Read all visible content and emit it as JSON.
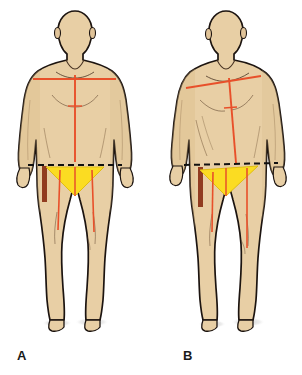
{
  "illustration": {
    "title": "Postural alignment comparison of two standing male figures",
    "background_color": "#ffffff",
    "panels": [
      {
        "id": "A",
        "label": "A",
        "label_x": 17,
        "label_y": 348,
        "caption": "Neutral symmetric standing posture with level reference lines",
        "posture": "aligned",
        "figure": {
          "skin_fill": "#e8cfa5",
          "skin_shade": "#d9b988",
          "outline_color": "#1c1410",
          "outline_width": 1.6,
          "center_x": 75,
          "head_center_x": 75,
          "head_center_y": 33,
          "head_rx": 17,
          "head_ry": 22
        },
        "markings": {
          "horizontal_line": {
            "name": "clavicular-reference-line",
            "color": "#e8502a",
            "x1": 33,
            "y1": 79,
            "x2": 116,
            "y2": 79,
            "width": 1.8,
            "tilt_degrees": 0
          },
          "vertical_line": {
            "name": "body-midline",
            "color": "#e8502a",
            "x1": 75,
            "y1": 75,
            "x2": 75,
            "y2": 162,
            "width": 1.8
          },
          "sternal_tick": {
            "name": "sternal-tick-mark",
            "color": "#e8502a",
            "x1": 68,
            "y1": 106,
            "x2": 82,
            "y2": 106,
            "width": 1.4
          },
          "dashed_line": {
            "name": "iliac-crest-line",
            "color": "#111111",
            "x1": 28,
            "y1": 165,
            "x2": 122,
            "y2": 165,
            "width": 2,
            "dash": "6 4",
            "tilt_degrees": 0
          },
          "triangle": {
            "name": "inguinal-triangle",
            "fill": "#fbdc22",
            "stroke": "#e0bd12",
            "points": "46,167 104,167 75,196",
            "apex_x": 75,
            "apex_y": 196
          },
          "lateral_band": {
            "name": "lateral-reference-band",
            "color": "#8c3418",
            "x": 42,
            "y": 166,
            "width": 5,
            "height": 36
          },
          "thigh_lines": [
            {
              "name": "left-thigh-line",
              "color": "#e8502a",
              "x1": 60,
              "y1": 170,
              "x2": 58,
              "y2": 230,
              "width": 1.6
            },
            {
              "name": "right-thigh-line",
              "color": "#e8502a",
              "x1": 92,
              "y1": 170,
              "x2": 94,
              "y2": 232,
              "width": 1.6
            }
          ],
          "shadow": {
            "name": "floor-shadow",
            "color": "#cfcfcf",
            "cx": 92,
            "cy": 322,
            "rx": 17,
            "ry": 4
          }
        }
      },
      {
        "id": "B",
        "label": "B",
        "label_x": 183,
        "label_y": 348,
        "caption": "Rotated asymmetric standing posture with oblique reference lines",
        "posture": "rotated",
        "figure": {
          "skin_fill": "#e8cfa5",
          "skin_shade": "#d9b988",
          "outline_color": "#1c1410",
          "outline_width": 1.6,
          "center_x": 228,
          "head_center_x": 226,
          "head_center_y": 33,
          "head_rx": 17,
          "head_ry": 22
        },
        "markings": {
          "horizontal_line": {
            "name": "clavicular-reference-line",
            "color": "#e8502a",
            "x1": 186,
            "y1": 88,
            "x2": 261,
            "y2": 76,
            "width": 1.8,
            "tilt_degrees": -9
          },
          "vertical_line": {
            "name": "body-midline",
            "color": "#e8502a",
            "x1": 229,
            "y1": 78,
            "x2": 236,
            "y2": 163,
            "width": 1.8
          },
          "sternal_tick": {
            "name": "sternal-tick-mark",
            "color": "#e8502a",
            "x1": 224,
            "y1": 108,
            "x2": 237,
            "y2": 107,
            "width": 1.4
          },
          "dashed_line": {
            "name": "iliac-crest-line",
            "color": "#111111",
            "x1": 184,
            "y1": 165,
            "x2": 278,
            "y2": 163,
            "width": 2,
            "dash": "6 4",
            "tilt_degrees": -1
          },
          "triangle": {
            "name": "inguinal-triangle",
            "fill": "#fbdc22",
            "stroke": "#e0bd12",
            "points": "200,170 258,166 226,196",
            "apex_x": 226,
            "apex_y": 196
          },
          "lateral_band": {
            "name": "lateral-reference-band",
            "color": "#8c3418",
            "x": 198,
            "y": 167,
            "width": 5,
            "height": 40
          },
          "thigh_lines": [
            {
              "name": "left-thigh-line",
              "color": "#e8502a",
              "x1": 213,
              "y1": 172,
              "x2": 212,
              "y2": 232,
              "width": 1.6
            },
            {
              "name": "right-thigh-line",
              "color": "#e8502a",
              "x1": 247,
              "y1": 168,
              "x2": 247,
              "y2": 248,
              "width": 1.6
            }
          ],
          "shadow": {
            "name": "floor-shadow",
            "color": "#cfcfcf",
            "cx": 248,
            "cy": 322,
            "rx": 17,
            "ry": 4
          }
        }
      }
    ],
    "palette": {
      "skin": "#e8cfa5",
      "skin_shade": "#d9b988",
      "outline": "#1c1410",
      "reference_line": "#e8502a",
      "triangle": "#fbdc22",
      "band": "#8c3418",
      "dashed": "#111111",
      "shadow": "#cfcfcf",
      "label_text": "#1a1a1a"
    }
  }
}
